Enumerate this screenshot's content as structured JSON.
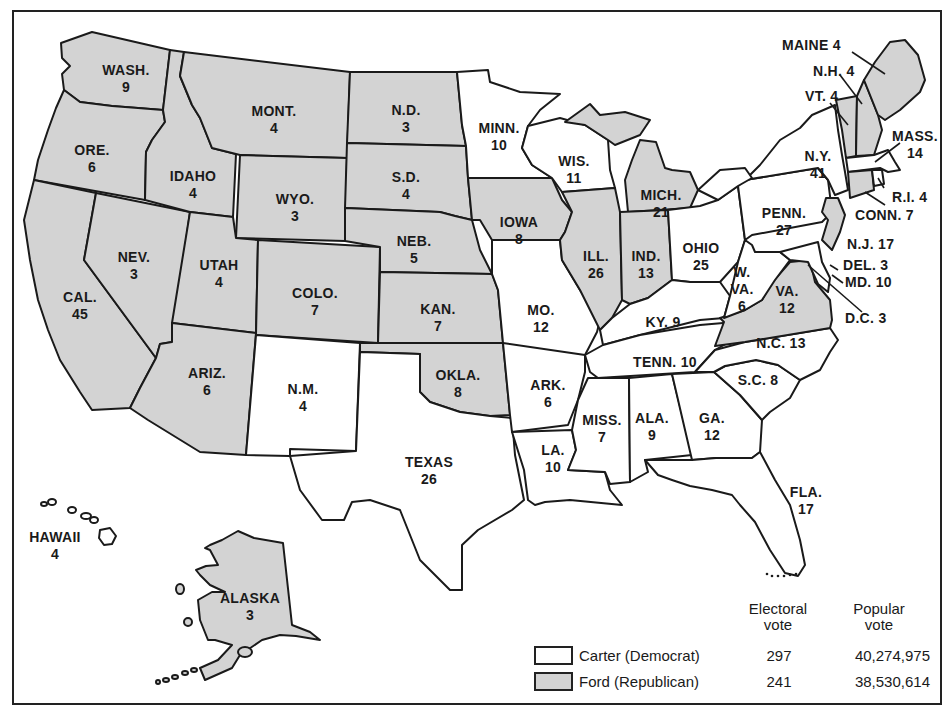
{
  "map": {
    "title": "1976 Presidential Election Electoral Map",
    "colors": {
      "carter": "#ffffff",
      "ford": "#d3d3d3",
      "border": "#1a1a1a"
    },
    "states": [
      {
        "abbr": "WASH.",
        "ev": "9",
        "party": "ford"
      },
      {
        "abbr": "ORE.",
        "ev": "6",
        "party": "ford"
      },
      {
        "abbr": "CAL.",
        "ev": "45",
        "party": "ford"
      },
      {
        "abbr": "IDAHO",
        "ev": "4",
        "party": "ford"
      },
      {
        "abbr": "NEV.",
        "ev": "3",
        "party": "ford"
      },
      {
        "abbr": "MONT.",
        "ev": "4",
        "party": "ford"
      },
      {
        "abbr": "WYO.",
        "ev": "3",
        "party": "ford"
      },
      {
        "abbr": "UTAH",
        "ev": "4",
        "party": "ford"
      },
      {
        "abbr": "ARIZ.",
        "ev": "6",
        "party": "ford"
      },
      {
        "abbr": "COLO.",
        "ev": "7",
        "party": "ford"
      },
      {
        "abbr": "N.M.",
        "ev": "4",
        "party": "ford"
      },
      {
        "abbr": "N.D.",
        "ev": "3",
        "party": "ford"
      },
      {
        "abbr": "S.D.",
        "ev": "4",
        "party": "ford"
      },
      {
        "abbr": "NEB.",
        "ev": "5",
        "party": "ford"
      },
      {
        "abbr": "KAN.",
        "ev": "7",
        "party": "ford"
      },
      {
        "abbr": "OKLA.",
        "ev": "8",
        "party": "ford"
      },
      {
        "abbr": "TEXAS",
        "ev": "26",
        "party": "carter"
      },
      {
        "abbr": "MINN.",
        "ev": "10",
        "party": "carter"
      },
      {
        "abbr": "IOWA",
        "ev": "8",
        "party": "ford"
      },
      {
        "abbr": "MO.",
        "ev": "12",
        "party": "carter"
      },
      {
        "abbr": "ARK.",
        "ev": "6",
        "party": "carter"
      },
      {
        "abbr": "LA.",
        "ev": "10",
        "party": "carter"
      },
      {
        "abbr": "WIS.",
        "ev": "11",
        "party": "carter"
      },
      {
        "abbr": "ILL.",
        "ev": "26",
        "party": "ford"
      },
      {
        "abbr": "MICH.",
        "ev": "21",
        "party": "ford"
      },
      {
        "abbr": "IND.",
        "ev": "13",
        "party": "ford"
      },
      {
        "abbr": "OHIO",
        "ev": "25",
        "party": "carter"
      },
      {
        "abbr": "KY.",
        "ev": "9",
        "party": "carter"
      },
      {
        "abbr": "TENN.",
        "ev": "10",
        "party": "carter"
      },
      {
        "abbr": "MISS.",
        "ev": "7",
        "party": "carter"
      },
      {
        "abbr": "ALA.",
        "ev": "9",
        "party": "carter"
      },
      {
        "abbr": "GA.",
        "ev": "12",
        "party": "carter"
      },
      {
        "abbr": "FLA.",
        "ev": "17",
        "party": "carter"
      },
      {
        "abbr": "S.C.",
        "ev": "8",
        "party": "carter"
      },
      {
        "abbr": "N.C.",
        "ev": "13",
        "party": "carter"
      },
      {
        "abbr": "VA.",
        "ev": "12",
        "party": "ford"
      },
      {
        "abbr": "W. VA.",
        "ev": "6",
        "party": "carter"
      },
      {
        "abbr": "PENN.",
        "ev": "27",
        "party": "carter"
      },
      {
        "abbr": "N.Y.",
        "ev": "41",
        "party": "carter"
      },
      {
        "abbr": "N.J.",
        "ev": "17",
        "party": "ford"
      },
      {
        "abbr": "DEL.",
        "ev": "3",
        "party": "carter"
      },
      {
        "abbr": "MD.",
        "ev": "10",
        "party": "carter"
      },
      {
        "abbr": "D.C.",
        "ev": "3",
        "party": "carter"
      },
      {
        "abbr": "CONN.",
        "ev": "7",
        "party": "ford"
      },
      {
        "abbr": "R.I.",
        "ev": "4",
        "party": "carter"
      },
      {
        "abbr": "MASS.",
        "ev": "14",
        "party": "carter"
      },
      {
        "abbr": "VT.",
        "ev": "4",
        "party": "ford"
      },
      {
        "abbr": "N.H.",
        "ev": "4",
        "party": "ford"
      },
      {
        "abbr": "MAINE",
        "ev": "4",
        "party": "ford"
      },
      {
        "abbr": "HAWAII",
        "ev": "4",
        "party": "carter"
      },
      {
        "abbr": "ALASKA",
        "ev": "3",
        "party": "ford"
      }
    ],
    "labels": {
      "wash": [
        "WASH.",
        "9"
      ],
      "ore": [
        "ORE.",
        "6"
      ],
      "cal": [
        "CAL.",
        "45"
      ],
      "idaho": [
        "IDAHO",
        "4"
      ],
      "nev": [
        "NEV.",
        "3"
      ],
      "mont": [
        "MONT.",
        "4"
      ],
      "wyo": [
        "WYO.",
        "3"
      ],
      "utah": [
        "UTAH",
        "4"
      ],
      "ariz": [
        "ARIZ.",
        "6"
      ],
      "colo": [
        "COLO.",
        "7"
      ],
      "nm": [
        "N.M.",
        "4"
      ],
      "nd": [
        "N.D.",
        "3"
      ],
      "sd": [
        "S.D.",
        "4"
      ],
      "neb": [
        "NEB.",
        "5"
      ],
      "kan": [
        "KAN.",
        "7"
      ],
      "okla": [
        "OKLA.",
        "8"
      ],
      "texas": [
        "TEXAS",
        "26"
      ],
      "minn": [
        "MINN.",
        "10"
      ],
      "iowa": [
        "IOWA",
        "8"
      ],
      "mo": [
        "MO.",
        "12"
      ],
      "ark": [
        "ARK.",
        "6"
      ],
      "la": [
        "LA.",
        "10"
      ],
      "wis": [
        "WIS.",
        "11"
      ],
      "ill": [
        "ILL.",
        "26"
      ],
      "mich": [
        "MICH.",
        "21"
      ],
      "ind": [
        "IND.",
        "13"
      ],
      "ohio": [
        "OHIO",
        "25"
      ],
      "ky": "KY. 9",
      "tenn": "TENN. 10",
      "miss": [
        "MISS.",
        "7"
      ],
      "ala": [
        "ALA.",
        "9"
      ],
      "ga": [
        "GA.",
        "12"
      ],
      "fla": [
        "FLA.",
        "17"
      ],
      "sc": "S.C. 8",
      "nc": "N.C. 13",
      "va": [
        "VA.",
        "12"
      ],
      "wva": [
        "W.",
        "VA.",
        "6"
      ],
      "penn": [
        "PENN.",
        "27"
      ],
      "ny": [
        "N.Y.",
        "41"
      ],
      "nj": "N.J. 17",
      "del": "DEL. 3",
      "md": "MD. 10",
      "dc": "D.C. 3",
      "conn": "CONN. 7",
      "ri": "R.I. 4",
      "mass": [
        "MASS.",
        "14"
      ],
      "vt": "VT. 4",
      "nh": "N.H. 4",
      "maine": "MAINE 4",
      "hawaii": [
        "HAWAII",
        "4"
      ],
      "alaska": [
        "ALASKA",
        "3"
      ]
    }
  },
  "legend": {
    "col_electoral": [
      "Electoral",
      "vote"
    ],
    "col_popular": [
      "Popular",
      "vote"
    ],
    "rows": [
      {
        "name": "Carter (Democrat)",
        "electoral": "297",
        "popular": "40,274,975",
        "color": "#ffffff"
      },
      {
        "name": "Ford (Republican)",
        "electoral": "241",
        "popular": "38,530,614",
        "color": "#d3d3d3"
      }
    ]
  }
}
